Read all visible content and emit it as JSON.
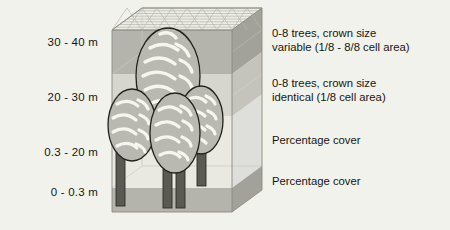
{
  "figure": {
    "background_color": "#f2f2ec",
    "box": {
      "top_face_label": "grid-top-face",
      "grid_cells": 8,
      "outline_color": "#8a8a80"
    },
    "strata": [
      {
        "id": "stratum-30-40",
        "height_label": "30 - 40 m",
        "fill": "#b4b4ac",
        "attribute": "0-8 trees, crown size variable (1/8 - 8/8 cell area)"
      },
      {
        "id": "stratum-20-30",
        "height_label": "20 - 30 m",
        "fill": "#d2d2ca",
        "attribute": "0-8 trees, crown size identical (1/8 cell area)"
      },
      {
        "id": "stratum-03-20",
        "height_label": "0.3 - 20 m",
        "fill": "#e6e6de",
        "attribute": "Percentage cover"
      },
      {
        "id": "stratum-0-03",
        "height_label": "0 - 0.3 m",
        "fill": "#b4b4ac",
        "attribute": "Percentage cover"
      }
    ],
    "left_labels": [
      {
        "text": "30 - 40 m",
        "top": 36
      },
      {
        "text": "20 - 30 m",
        "top": 91
      },
      {
        "text": "0.3 - 20 m",
        "top": 146
      },
      {
        "text": "0 - 0.3 m",
        "top": 186
      }
    ],
    "right_labels": [
      {
        "line1": "0-8 trees, crown size",
        "line2": "variable (1/8 - 8/8 cell area)",
        "top": 26
      },
      {
        "line1": "0-8 trees, crown size",
        "line2": "identical (1/8 cell area)",
        "top": 76
      },
      {
        "line1": "Percentage cover",
        "line2": "",
        "top": 133
      },
      {
        "line1": "Percentage cover",
        "line2": "",
        "top": 174
      }
    ],
    "trees": [
      {
        "id": "tree-tall-center",
        "crown_fill": "#b9b9b1",
        "trunk_fill": "#5a5a52"
      },
      {
        "id": "tree-left",
        "crown_fill": "#b9b9b1",
        "trunk_fill": "#5a5a52"
      },
      {
        "id": "tree-right",
        "crown_fill": "#b9b9b1",
        "trunk_fill": "#5a5a52"
      },
      {
        "id": "tree-front-center",
        "crown_fill": "#b9b9b1",
        "trunk_fill": "#5a5a52"
      }
    ]
  }
}
